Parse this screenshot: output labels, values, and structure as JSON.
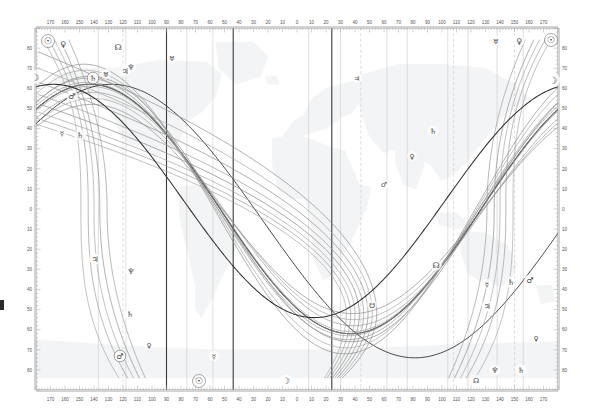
{
  "figure": {
    "kind": "astrocartography-world-map",
    "background_map": "faint world continents raster",
    "frame_color": "#9a9a9a",
    "plot_rect": {
      "x": 36,
      "y": 28,
      "width": 522,
      "height": 362
    }
  },
  "axes": {
    "x": {
      "label": "Longitude (degrees)",
      "west_ticks": [
        170,
        160,
        150,
        140,
        130,
        120,
        110,
        100,
        90,
        80,
        70,
        60,
        50,
        40,
        30,
        20,
        10
      ],
      "center_tick": 0,
      "east_ticks": [
        10,
        20,
        30,
        40,
        50,
        60,
        70,
        80,
        90,
        100,
        110,
        120,
        130,
        140,
        150,
        160,
        170
      ],
      "minor_tick_step": 2,
      "top_ticks_visible": true,
      "bottom_ticks_visible": true
    },
    "y": {
      "label": "Latitude (degrees)",
      "north_ticks": [
        80,
        70,
        60,
        50,
        40,
        30,
        20,
        10
      ],
      "equator_tick": 0,
      "south_ticks": [
        10,
        20,
        30,
        40,
        50,
        60,
        70,
        80
      ],
      "minor_tick_step": 2,
      "left_ticks_visible": true,
      "right_ticks_visible": true
    }
  },
  "grid": {
    "meridian_color": "#c9c9c9",
    "dashed_meridian_color": "#cfcfcf",
    "dark_meridian_color": "#3a3a3a",
    "solid_meridians": [
      -137,
      -118,
      -90,
      -76,
      -58,
      -44,
      8,
      24,
      30,
      62,
      76,
      104,
      118,
      138,
      156
    ],
    "dashed_meridians": [
      -120,
      44,
      108,
      150
    ],
    "dark_meridians": [
      -90,
      -44,
      24
    ]
  },
  "bodies": [
    {
      "key": "sun",
      "name": "Sun",
      "glyph": "☉",
      "color": "#8a8a8a"
    },
    {
      "key": "moon",
      "name": "Moon",
      "glyph": "☽",
      "color": "#555555"
    },
    {
      "key": "mercury",
      "name": "Mercury",
      "glyph": "☿",
      "color": "#9a9a9a"
    },
    {
      "key": "venus",
      "name": "Venus",
      "glyph": "♀",
      "color": "#8f8f8f"
    },
    {
      "key": "mars",
      "name": "Mars",
      "glyph": "♂",
      "color": "#8a8a8a"
    },
    {
      "key": "jupiter",
      "name": "Jupiter",
      "glyph": "♃",
      "color": "#909090"
    },
    {
      "key": "saturn",
      "name": "Saturn",
      "glyph": "♄",
      "color": "#777777"
    },
    {
      "key": "uranus",
      "name": "Uranus",
      "glyph": "♅",
      "color": "#999999"
    },
    {
      "key": "neptune",
      "name": "Neptune",
      "glyph": "♆",
      "color": "#8b8b8b"
    },
    {
      "key": "pluto",
      "name": "Pluto",
      "glyph": "♇",
      "color": "#8b8b8b"
    },
    {
      "key": "north_node",
      "name": "North Node",
      "glyph": "☊",
      "color": "#6f6f6f"
    },
    {
      "key": "south_node",
      "name": "South Node",
      "glyph": "☋",
      "color": "#6f6f6f"
    }
  ],
  "markers": [
    {
      "body": "sun",
      "glyph": "☉",
      "x": 48,
      "y": 41,
      "size": 9,
      "circled": true
    },
    {
      "body": "venus",
      "glyph": "♀",
      "x": 63,
      "y": 44,
      "size": 8
    },
    {
      "body": "north_node",
      "glyph": "☊",
      "x": 118,
      "y": 47,
      "size": 8
    },
    {
      "body": "uranus",
      "glyph": "♅",
      "x": 172,
      "y": 58,
      "size": 7
    },
    {
      "body": "sun",
      "glyph": "☉",
      "x": 551,
      "y": 40,
      "size": 9,
      "circled": true
    },
    {
      "body": "venus",
      "glyph": "♀",
      "x": 519,
      "y": 41,
      "size": 8
    },
    {
      "body": "uranus",
      "glyph": "♅",
      "x": 496,
      "y": 41,
      "size": 7
    },
    {
      "body": "moon",
      "glyph": "☽",
      "x": 35,
      "y": 77,
      "size": 10
    },
    {
      "body": "saturn",
      "glyph": "♄",
      "x": 93,
      "y": 78,
      "size": 8,
      "circled": true
    },
    {
      "body": "uranus",
      "glyph": "♅",
      "x": 106,
      "y": 74,
      "size": 7
    },
    {
      "body": "neptune",
      "glyph": "♆",
      "x": 131,
      "y": 67,
      "size": 8
    },
    {
      "body": "jupiter",
      "glyph": "♃",
      "x": 125,
      "y": 71,
      "size": 8
    },
    {
      "body": "jupiter",
      "glyph": "♃",
      "x": 357,
      "y": 78,
      "size": 7
    },
    {
      "body": "moon",
      "glyph": "☽",
      "x": 553,
      "y": 80,
      "size": 10
    },
    {
      "body": "mars",
      "glyph": "♂",
      "x": 72,
      "y": 96,
      "size": 8
    },
    {
      "body": "mercury",
      "glyph": "☿",
      "x": 62,
      "y": 133,
      "size": 7
    },
    {
      "body": "saturn",
      "glyph": "♄",
      "x": 80,
      "y": 135,
      "size": 8
    },
    {
      "body": "saturn",
      "glyph": "♄",
      "x": 433,
      "y": 131,
      "size": 8
    },
    {
      "body": "venus",
      "glyph": "♀",
      "x": 412,
      "y": 156,
      "size": 7
    },
    {
      "body": "mars",
      "glyph": "♂",
      "x": 384,
      "y": 184,
      "size": 7
    },
    {
      "body": "jupiter",
      "glyph": "♃",
      "x": 95,
      "y": 259,
      "size": 8
    },
    {
      "body": "neptune",
      "glyph": "♆",
      "x": 131,
      "y": 271,
      "size": 8
    },
    {
      "body": "north_node",
      "glyph": "☊",
      "x": 436,
      "y": 265,
      "size": 8
    },
    {
      "body": "south_node",
      "glyph": "☋",
      "x": 372,
      "y": 305,
      "size": 7
    },
    {
      "body": "mercury",
      "glyph": "☿",
      "x": 487,
      "y": 284,
      "size": 7
    },
    {
      "body": "saturn",
      "glyph": "♄",
      "x": 511,
      "y": 282,
      "size": 8
    },
    {
      "body": "mars",
      "glyph": "♂",
      "x": 530,
      "y": 280,
      "size": 8
    },
    {
      "body": "jupiter",
      "glyph": "♃",
      "x": 487,
      "y": 306,
      "size": 8
    },
    {
      "body": "saturn",
      "glyph": "♄",
      "x": 130,
      "y": 314,
      "size": 8
    },
    {
      "body": "venus",
      "glyph": "♀",
      "x": 536,
      "y": 338,
      "size": 7
    },
    {
      "body": "mars",
      "glyph": "♂",
      "x": 120,
      "y": 356,
      "size": 8,
      "circled": true
    },
    {
      "body": "venus",
      "glyph": "♀",
      "x": 149,
      "y": 345,
      "size": 7
    },
    {
      "body": "mercury",
      "glyph": "☿",
      "x": 214,
      "y": 356,
      "size": 7
    },
    {
      "body": "sun",
      "glyph": "☉",
      "x": 199,
      "y": 381,
      "size": 9,
      "circled": true
    },
    {
      "body": "moon",
      "glyph": "☽",
      "x": 286,
      "y": 381,
      "size": 9
    },
    {
      "body": "neptune",
      "glyph": "♆",
      "x": 495,
      "y": 370,
      "size": 8
    },
    {
      "body": "saturn",
      "glyph": "♄",
      "x": 521,
      "y": 370,
      "size": 8
    },
    {
      "body": "north_node",
      "glyph": "☊",
      "x": 476,
      "y": 380,
      "size": 7
    }
  ],
  "curves": {
    "note": "Planetary AC/DC (great-circle) and MC/IC (meridian) lines plotted over the world map.",
    "count": 26
  }
}
